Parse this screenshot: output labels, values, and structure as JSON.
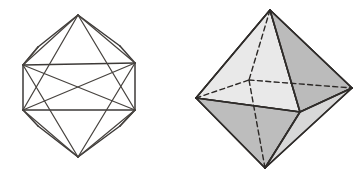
{
  "page": {
    "background_color": "#ffffff",
    "width": 364,
    "height": 185
  },
  "figures": [
    {
      "id": "wireframe-polyhedron",
      "name": "icosahedron-wireframe",
      "style": "line drawing, no shading",
      "line_color": "#3d3a38",
      "fill": "none",
      "vertices": {
        "top_apex": [
          78,
          15
        ],
        "bottom_apex": [
          78,
          157
        ],
        "rect_top_left": [
          23,
          65
        ],
        "rect_top_right": [
          135,
          63
        ],
        "rect_bottom_left": [
          23,
          110
        ],
        "rect_bottom_right": [
          135,
          110
        ],
        "upper_left_shoulder": [
          38,
          47
        ],
        "upper_right_shoulder": [
          120,
          46
        ],
        "lower_left_knee": [
          38,
          126
        ],
        "lower_right_knee": [
          120,
          126
        ]
      },
      "edge_count": 20
    },
    {
      "id": "shaded-octahedron",
      "name": "octahedron-solid",
      "style": "shaded solid with hidden dashed edges",
      "outline_color": "#2f2c2a",
      "hidden_edge_color": "#2b2826",
      "hidden_edge_dash": "dashed",
      "face_colors": {
        "upper_left": "#e9e9e9",
        "upper_right": "#bbbbbb",
        "lower_left": "#bdbdbd",
        "lower_right": "#d8d8d8",
        "top_center": "#efefef",
        "inner_small": "#e4e4e4"
      },
      "vertices": {
        "top_apex": [
          270,
          10
        ],
        "bottom_apex": [
          265,
          168
        ],
        "left": [
          196,
          98
        ],
        "right": [
          352,
          88
        ],
        "front": [
          300,
          112
        ],
        "back_hidden": [
          249,
          80
        ]
      },
      "face_count": 8,
      "vertex_count": 6
    }
  ]
}
